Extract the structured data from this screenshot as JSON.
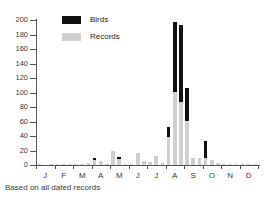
{
  "chart_data": {
    "type": "bar",
    "subtype": "stacked-bar",
    "title": "",
    "subtitle": "",
    "caption": "Based on all dated records",
    "xlabel": "",
    "ylabel": "",
    "ylim": [
      0,
      200
    ],
    "ytick_values": [
      0,
      20,
      40,
      60,
      80,
      100,
      120,
      140,
      160,
      180,
      200
    ],
    "ytick_labels": [
      "0",
      "20",
      "40",
      "60",
      "80",
      "100",
      "120",
      "140",
      "160",
      "180",
      "200"
    ],
    "grid": false,
    "legend_position": "top-left-inside",
    "month_labels": [
      "J",
      "F",
      "M",
      "A",
      "M",
      "J",
      "J",
      "A",
      "S",
      "O",
      "N",
      "D"
    ],
    "periods_per_month": 3,
    "x_note": "36 ten-day periods, three per month",
    "categories": [
      "J-1",
      "J-2",
      "J-3",
      "F-1",
      "F-2",
      "F-3",
      "M-1",
      "M-2",
      "M-3",
      "A-1",
      "A-2",
      "A-3",
      "M-1",
      "M-2",
      "M-3",
      "J-1",
      "J-2",
      "J-3",
      "J-1",
      "J-2",
      "J-3",
      "A-1",
      "A-2",
      "A-3",
      "S-1",
      "S-2",
      "S-3",
      "O-1",
      "O-2",
      "O-3",
      "N-1",
      "N-2",
      "N-3",
      "D-1",
      "D-2",
      "D-3"
    ],
    "series": [
      {
        "name": "Records",
        "color": "#cfcfcf",
        "values": [
          1,
          0,
          1,
          1,
          1,
          1,
          2,
          1,
          3,
          7,
          5,
          2,
          19,
          8,
          1,
          1,
          16,
          5,
          4,
          12,
          3,
          39,
          101,
          87,
          61,
          10,
          9,
          9,
          7,
          3,
          2,
          2,
          1,
          2,
          1,
          1
        ]
      },
      {
        "name": "Birds",
        "color": "#111111",
        "values": [
          0,
          0,
          0,
          0,
          0,
          0,
          0,
          0,
          0,
          3,
          0,
          0,
          0,
          3,
          0,
          0,
          0,
          0,
          0,
          0,
          0,
          13,
          96,
          106,
          45,
          0,
          0,
          24,
          0,
          0,
          0,
          0,
          0,
          0,
          0,
          0
        ]
      }
    ],
    "totals": [
      1,
      0,
      1,
      1,
      1,
      1,
      2,
      1,
      3,
      10,
      5,
      2,
      19,
      11,
      1,
      1,
      16,
      5,
      4,
      12,
      3,
      52,
      197,
      193,
      106,
      10,
      9,
      33,
      7,
      3,
      2,
      2,
      1,
      2,
      1,
      1
    ]
  },
  "legend": {
    "items": [
      {
        "label": "Birds",
        "color": "#111111"
      },
      {
        "label": "Records",
        "color": "#cfcfcf"
      }
    ]
  }
}
